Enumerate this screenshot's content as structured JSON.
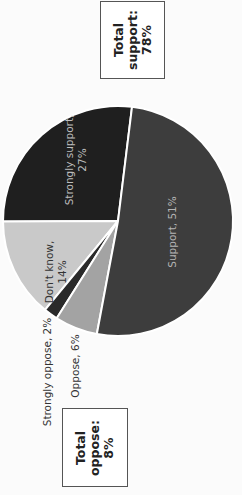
{
  "chart_data": {
    "type": "pie",
    "orientation": "rotated -90deg (labels read bottom-to-top)",
    "title": "",
    "slices": [
      {
        "label": "Strongly support",
        "value": 27,
        "color": "#1f1f1f",
        "text_color": "#bdbdbd",
        "label_text": "Strongly support,",
        "value_text": "27%",
        "label_position": "inside"
      },
      {
        "label": "Don't know",
        "value": 14,
        "color": "#c9c9c9",
        "text_color": "#333333",
        "label_text": "Don't know,",
        "value_text": "14%",
        "label_position": "inside"
      },
      {
        "label": "Strongly oppose",
        "value": 2,
        "color": "#2a2a2a",
        "text_color": "#333333",
        "label_text": "Strongly oppose, 2%",
        "value_text": "",
        "label_position": "outside"
      },
      {
        "label": "Oppose",
        "value": 6,
        "color": "#a3a3a3",
        "text_color": "#333333",
        "label_text": "Oppose, 6%",
        "value_text": "",
        "label_position": "outside"
      },
      {
        "label": "Support",
        "value": 51,
        "color": "#3d3d3d",
        "text_color": "#b5b5b5",
        "label_text": "Support, 51%",
        "value_text": "",
        "label_position": "inside"
      }
    ],
    "start_angle_deg_clockwise_from_top": 7,
    "direction": "counter-clockwise",
    "annotations": [
      {
        "name": "total-support",
        "lines": [
          "Total",
          "support:",
          "78%"
        ]
      },
      {
        "name": "total-oppose",
        "lines": [
          "Total",
          "oppose:",
          "8%"
        ]
      }
    ]
  },
  "summary": {
    "support": {
      "line1": "Total",
      "line2": "support:",
      "line3": "78%"
    },
    "oppose": {
      "line1": "Total",
      "line2": "oppose:",
      "line3": "8%"
    }
  }
}
